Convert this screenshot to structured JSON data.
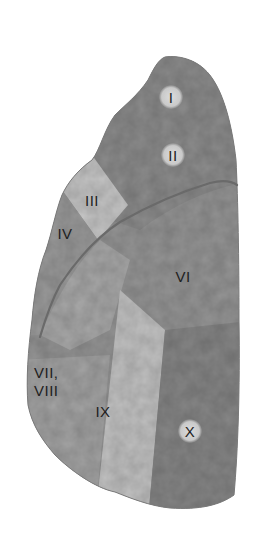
{
  "figure": {
    "background": "#ffffff",
    "colors": {
      "lobe_dark": "#8a8a8a",
      "lobe_mid": "#9c9c9c",
      "segment_III": "#c4c4c4",
      "segment_IX": "#c0c0c0",
      "segment_X": "#858585",
      "fissure": "#6a6a6a",
      "label_text": "#1e1e1e"
    },
    "segments": [
      {
        "id": "I",
        "label": "I"
      },
      {
        "id": "II",
        "label": "II"
      },
      {
        "id": "III",
        "label": "III"
      },
      {
        "id": "IV",
        "label": "IV"
      },
      {
        "id": "VI",
        "label": "VI"
      },
      {
        "id": "VII_VIII",
        "label_line1": "VII,",
        "label_line2": "VIII"
      },
      {
        "id": "IX",
        "label": "IX"
      },
      {
        "id": "X",
        "label": "X"
      }
    ]
  }
}
